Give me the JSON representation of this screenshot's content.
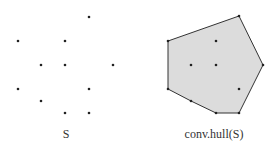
{
  "left": {
    "label": "S",
    "points": [
      [
        89,
        17
      ],
      [
        18,
        41
      ],
      [
        65,
        41
      ],
      [
        41,
        65
      ],
      [
        65,
        65
      ],
      [
        113,
        65
      ],
      [
        18,
        89
      ],
      [
        89,
        89
      ],
      [
        41,
        101
      ],
      [
        65,
        113
      ],
      [
        89,
        113
      ]
    ]
  },
  "right": {
    "label": "conv.hull(S)",
    "hull": [
      [
        168,
        41
      ],
      [
        239,
        16
      ],
      [
        263,
        65
      ],
      [
        239,
        113
      ],
      [
        216,
        113
      ],
      [
        191,
        101
      ],
      [
        168,
        89
      ]
    ],
    "interior": [
      [
        216,
        41
      ],
      [
        191,
        65
      ],
      [
        216,
        65
      ],
      [
        239,
        89
      ]
    ],
    "fill": "#dcdcdc",
    "stroke": "#333333"
  }
}
